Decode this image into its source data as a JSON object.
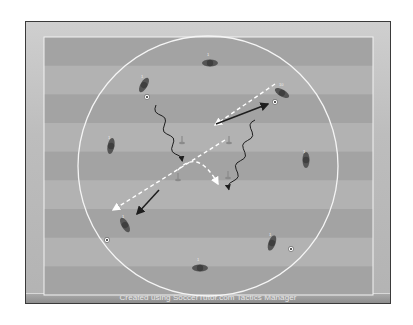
{
  "diagram": {
    "type": "soccer-tactics-drill",
    "caption": "Created using SoccerTutor.com Tactics Manager",
    "colors": {
      "frame_bg": "#c4c4c4",
      "stripe_dark": "#a3a3a3",
      "stripe_light": "#b2b2b2",
      "lines": "#f2f2f2",
      "player": "#555555",
      "arrow": "#1e1e1e",
      "pass": "#ffffff"
    },
    "pitch": {
      "x": 44,
      "y": 37,
      "width": 329,
      "height": 258,
      "stripes": 9
    },
    "circle": {
      "cx": 208,
      "cy": 166,
      "r": 130
    },
    "players": [
      {
        "id": "p-top",
        "label": "1",
        "x": 210,
        "y": 63,
        "rot": 0
      },
      {
        "id": "p-top-left",
        "label": "1",
        "x": 144,
        "y": 85,
        "rot": -60
      },
      {
        "id": "p-top-right",
        "label": "10",
        "x": 282,
        "y": 93,
        "rot": 30
      },
      {
        "id": "p-left",
        "label": "1",
        "x": 111,
        "y": 146,
        "rot": -80
      },
      {
        "id": "p-right",
        "label": "1",
        "x": 306,
        "y": 160,
        "rot": 90
      },
      {
        "id": "p-bottom-left",
        "label": "1",
        "x": 125,
        "y": 225,
        "rot": 60
      },
      {
        "id": "p-bottom-right",
        "label": "1",
        "x": 272,
        "y": 243,
        "rot": -70
      },
      {
        "id": "p-bottom",
        "label": "1",
        "x": 200,
        "y": 268,
        "rot": 0
      }
    ],
    "balls": [
      {
        "x": 147,
        "y": 97
      },
      {
        "x": 275,
        "y": 102
      },
      {
        "x": 107,
        "y": 240
      },
      {
        "x": 291,
        "y": 249
      }
    ],
    "cones": [
      {
        "x": 182,
        "y": 141
      },
      {
        "x": 229,
        "y": 141
      },
      {
        "x": 178,
        "y": 178
      },
      {
        "x": 228,
        "y": 176
      }
    ],
    "runs_with_ball": [
      {
        "from": [
          156,
          105
        ],
        "to": [
          180,
          162
        ]
      },
      {
        "from": [
          255,
          120
        ],
        "to": [
          230,
          190
        ]
      }
    ],
    "movement_arrows": [
      {
        "from": [
          216,
          124
        ],
        "to": [
          268,
          104
        ]
      },
      {
        "from": [
          159,
          190
        ],
        "to": [
          137,
          214
        ]
      }
    ],
    "passes": [
      {
        "from": [
          275,
          84
        ],
        "to": [
          215,
          125
        ],
        "curve": false
      },
      {
        "from": [
          225,
          140
        ],
        "to": [
          113,
          210
        ],
        "curve": false
      },
      {
        "from": [
          178,
          170
        ],
        "to": [
          218,
          184
        ],
        "curve": true
      }
    ]
  }
}
